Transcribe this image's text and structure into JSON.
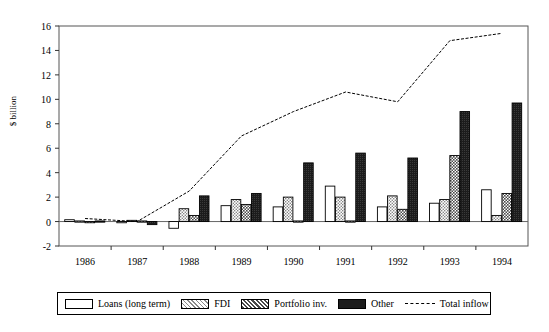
{
  "chart_data": {
    "type": "bar",
    "title": "",
    "subtitle": "",
    "xlabel": "",
    "ylabel": "$ billion",
    "categories": [
      "1986",
      "1987",
      "1988",
      "1989",
      "1990",
      "1991",
      "1992",
      "1993",
      "1994"
    ],
    "ylim": [
      -2,
      16
    ],
    "yticks": [
      -2,
      0,
      2,
      4,
      6,
      8,
      10,
      12,
      14,
      16
    ],
    "ytick_labels": [
      "-2",
      "0",
      "2",
      "4",
      "6",
      "8",
      "10",
      "12",
      "14",
      "16"
    ],
    "grid": false,
    "legend_position": "bottom",
    "series": [
      {
        "name": "Loans (long term)",
        "type": "bar",
        "fill": "white",
        "values": [
          0.15,
          -0.05,
          -0.55,
          1.3,
          1.2,
          2.9,
          1.2,
          1.5,
          2.6
        ]
      },
      {
        "name": "FDI",
        "type": "bar",
        "fill": "light-dotted",
        "values": [
          0.05,
          0.1,
          1.05,
          1.8,
          2.0,
          2.0,
          2.1,
          1.8,
          0.5
        ]
      },
      {
        "name": "Portfolio inv.",
        "type": "bar",
        "fill": "dark-checker",
        "values": [
          0.0,
          0.05,
          0.5,
          1.4,
          0.05,
          0.05,
          1.0,
          5.4,
          2.3
        ]
      },
      {
        "name": "Other",
        "type": "bar",
        "fill": "black",
        "values": [
          0.05,
          -0.25,
          2.1,
          2.3,
          4.8,
          5.6,
          5.2,
          9.0,
          9.7
        ]
      },
      {
        "name": "Total inflow",
        "type": "line",
        "style": "dashed",
        "values": [
          0.25,
          0.0,
          2.5,
          7.0,
          9.0,
          10.6,
          9.8,
          14.8,
          15.4
        ]
      }
    ]
  },
  "legend": {
    "items": [
      {
        "label": "Loans (long term)",
        "swatch": "white"
      },
      {
        "label": "FDI",
        "swatch": "light-dotted"
      },
      {
        "label": "Portfolio inv.",
        "swatch": "dark-checker"
      },
      {
        "label": "Other",
        "swatch": "black"
      },
      {
        "label": "Total inflow",
        "swatch": "dashed-line"
      }
    ]
  },
  "axis": {
    "y_title": "$ billion"
  }
}
